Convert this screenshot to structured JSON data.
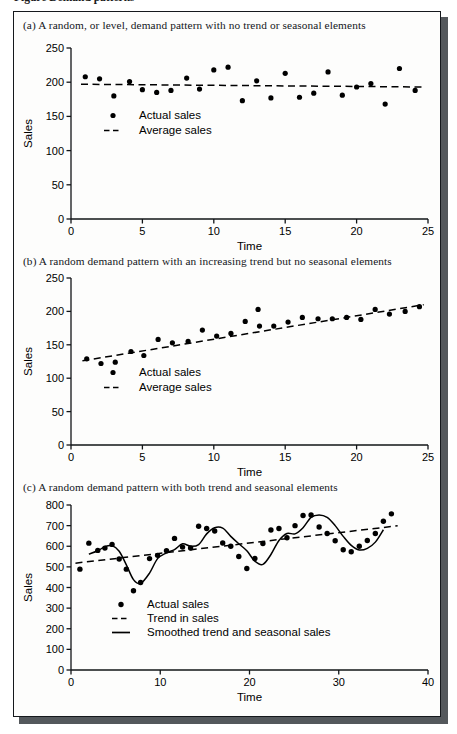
{
  "top_cut_caption": "Figure  Demand patterns",
  "figure": {
    "panels": [
      {
        "id": "panel-a",
        "caption": "(a) A random, or level, demand pattern with no trend or seasonal elements",
        "chart_data": {
          "type": "scatter",
          "title": "",
          "xlabel": "Time",
          "ylabel": "Sales",
          "xlim": [
            0,
            25
          ],
          "ylim": [
            0,
            250
          ],
          "xticks": [
            0,
            5,
            10,
            15,
            20,
            25
          ],
          "yticks": [
            0,
            50,
            100,
            150,
            200,
            250
          ],
          "grid": false,
          "legend_position": "inside-left",
          "legend": [
            {
              "label": "Actual sales",
              "marker": "dot"
            },
            {
              "label": "Average sales",
              "marker": "dashed-line"
            }
          ],
          "series": [
            {
              "name": "Actual sales",
              "marker": "dot",
              "x": [
                1.0,
                2.0,
                3.0,
                4.1,
                5.0,
                6.0,
                7.0,
                8.1,
                9.0,
                10.0,
                11.0,
                12.0,
                13.0,
                14.0,
                15.0,
                16.0,
                17.0,
                18.0,
                19.0,
                20.0,
                21.0,
                22.0,
                23.0,
                24.1
              ],
              "values": [
                208,
                205,
                180,
                201,
                189,
                185,
                188,
                206,
                190,
                218,
                222,
                173,
                202,
                177,
                213,
                178,
                184,
                215,
                181,
                193,
                198,
                168,
                220,
                188
              ]
            },
            {
              "name": "Average sales",
              "marker": "dashed-line",
              "x": [
                0.7,
                24.6
              ],
              "values": [
                197,
                193
              ]
            }
          ]
        }
      },
      {
        "id": "panel-b",
        "caption": "(b) A random demand pattern with an increasing trend but no seasonal elements",
        "chart_data": {
          "type": "scatter",
          "title": "",
          "xlabel": "Time",
          "ylabel": "Sales",
          "xlim": [
            0,
            25
          ],
          "ylim": [
            0,
            250
          ],
          "xticks": [
            0,
            5,
            10,
            15,
            20,
            25
          ],
          "yticks": [
            0,
            50,
            100,
            150,
            200,
            250
          ],
          "grid": false,
          "legend_position": "inside-left",
          "legend": [
            {
              "label": "Actual sales",
              "marker": "dot"
            },
            {
              "label": "Average sales",
              "marker": "dashed-line"
            }
          ],
          "series": [
            {
              "name": "Actual sales",
              "marker": "dot",
              "x": [
                1.1,
                2.1,
                3.1,
                4.2,
                5.1,
                6.1,
                7.1,
                8.2,
                9.2,
                10.2,
                11.2,
                12.2,
                13.1,
                13.2,
                14.2,
                15.2,
                16.2,
                17.3,
                18.3,
                19.3,
                20.3,
                21.3,
                22.3,
                23.4,
                24.4
              ],
              "values": [
                129,
                122,
                124,
                140,
                134,
                158,
                153,
                155,
                172,
                163,
                167,
                185,
                203,
                178,
                178,
                184,
                191,
                189,
                189,
                191,
                188,
                203,
                196,
                200,
                207
              ]
            },
            {
              "name": "Average sales",
              "marker": "dashed-line",
              "x": [
                0.8,
                24.7
              ],
              "values": [
                126,
                210
              ]
            }
          ]
        }
      },
      {
        "id": "panel-c",
        "caption": "(c) A random demand pattern with both trend and seasonal elements",
        "chart_data": {
          "type": "scatter",
          "title": "",
          "xlabel": "Time",
          "ylabel": "Sales",
          "xlim": [
            0,
            40
          ],
          "ylim": [
            0,
            800
          ],
          "xticks": [
            0,
            10,
            20,
            30,
            40
          ],
          "yticks": [
            0,
            100,
            200,
            300,
            400,
            500,
            600,
            700,
            800
          ],
          "grid": false,
          "legend_position": "inside-left",
          "legend": [
            {
              "label": "Actual sales",
              "marker": "dot"
            },
            {
              "label": "Trend in sales",
              "marker": "dashed-line"
            },
            {
              "label": "Smoothed trend and seasonal sales",
              "marker": "solid-line"
            }
          ],
          "series": [
            {
              "name": "Actual sales",
              "marker": "dot",
              "x": [
                1.0,
                2.0,
                3.0,
                3.8,
                4.6,
                5.4,
                6.2,
                7.0,
                7.8,
                8.8,
                9.7,
                10.7,
                11.6,
                12.5,
                13.4,
                14.3,
                15.2,
                16.1,
                17.0,
                17.9,
                18.8,
                19.7,
                20.6,
                21.5,
                22.4,
                23.3,
                24.2,
                25.1,
                26.0,
                26.9,
                27.8,
                28.7,
                29.6,
                30.5,
                31.4,
                32.3,
                33.2,
                34.1,
                35.0,
                35.9
              ],
              "values": [
                489,
                615,
                580,
                591,
                609,
                538,
                489,
                384,
                424,
                540,
                556,
                578,
                638,
                596,
                592,
                697,
                686,
                674,
                616,
                600,
                550,
                492,
                541,
                613,
                679,
                686,
                641,
                700,
                749,
                752,
                693,
                662,
                627,
                583,
                573,
                600,
                628,
                662,
                721,
                757
              ]
            },
            {
              "name": "Trend in sales",
              "marker": "dashed-line",
              "x": [
                0.5,
                36.6
              ],
              "values": [
                518,
                699
              ]
            },
            {
              "name": "Smoothed trend and seasonal sales",
              "marker": "solid-line",
              "x": [
                2.0,
                3.0,
                3.8,
                4.6,
                5.4,
                6.2,
                7.0,
                7.8,
                8.8,
                9.7,
                10.7,
                11.6,
                12.5,
                13.4,
                14.3,
                15.2,
                16.1,
                17.0,
                17.9,
                18.8,
                19.7,
                20.6,
                21.5,
                22.4,
                23.3,
                24.2,
                25.1,
                26.0,
                26.9,
                27.8,
                28.7,
                29.6,
                30.5,
                31.4,
                32.3,
                33.2,
                34.1,
                35.0
              ],
              "values": [
                562,
                578,
                598,
                603,
                576,
                510,
                438,
                420,
                470,
                540,
                568,
                584,
                612,
                600,
                608,
                660,
                690,
                688,
                648,
                612,
                578,
                528,
                512,
                560,
                628,
                662,
                660,
                690,
                740,
                752,
                740,
                700,
                648,
                604,
                582,
                590,
                620,
                680
              ]
            }
          ]
        }
      }
    ]
  }
}
